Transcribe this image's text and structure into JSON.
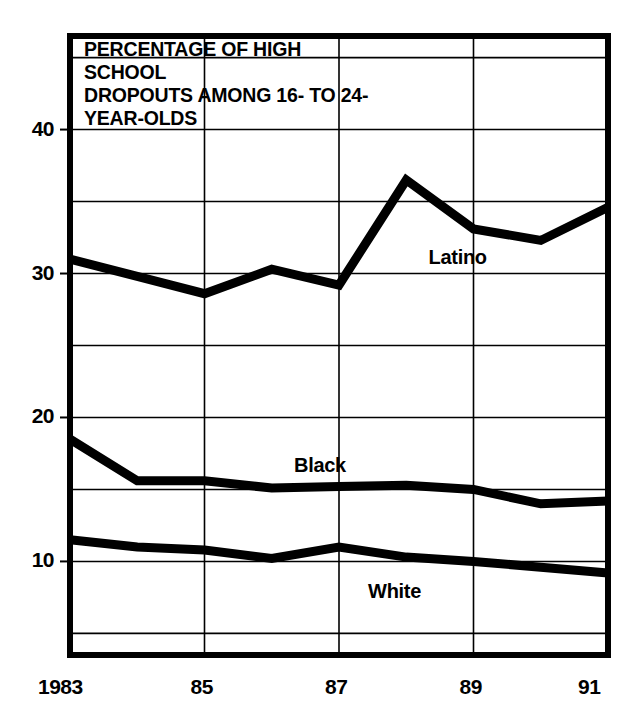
{
  "chart_data": {
    "type": "line",
    "title": "PERCENTAGE OF HIGH SCHOOL\nDROPOUTS AMONG 16- TO 24-\nYEAR-OLDS",
    "xlabel": "",
    "ylabel": "",
    "x": [
      1983,
      1984,
      1985,
      1986,
      1987,
      1988,
      1989,
      1990,
      1991
    ],
    "xtick_values": [
      1983,
      1985,
      1987,
      1989,
      1991
    ],
    "xtick_labels": [
      "1983",
      "85",
      "87",
      "89",
      "91"
    ],
    "ytick_values": [
      10,
      20,
      30,
      40
    ],
    "ytick_labels": [
      "10",
      "20",
      "30",
      "40"
    ],
    "xlim": [
      1983,
      1991
    ],
    "ylim": [
      3.5,
      46.5
    ],
    "grid": true,
    "grid_y_values": [
      5,
      10,
      15,
      20,
      25,
      30,
      35,
      40,
      45
    ],
    "grid_x_values": [
      1985,
      1987,
      1989
    ],
    "legend_position": "inline-annotations",
    "line_color": "#000000",
    "grid_color": "#000000",
    "background_color": "#ffffff",
    "series": [
      {
        "name": "Latino",
        "label_x": 1989.15,
        "label_y": 31.1,
        "values": [
          31.0,
          29.8,
          28.6,
          30.3,
          29.2,
          36.5,
          33.1,
          32.3,
          34.6
        ]
      },
      {
        "name": "Black",
        "label_x": 1987.15,
        "label_y": 16.6,
        "values": [
          18.5,
          15.6,
          15.6,
          15.1,
          15.2,
          15.3,
          15.0,
          14.0,
          14.2
        ]
      },
      {
        "name": "White",
        "label_x": 1988.25,
        "label_y": 7.9,
        "values": [
          11.5,
          11.0,
          10.8,
          10.2,
          11.0,
          10.3,
          10.0,
          9.6,
          9.2
        ]
      }
    ]
  }
}
